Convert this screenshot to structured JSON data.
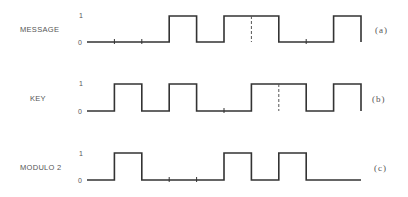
{
  "diagram": {
    "title": "",
    "x_start": 87,
    "bit_width": 27.4,
    "rows": [
      {
        "id": "message",
        "label": "MESSAGE",
        "tag": "(a)",
        "level_high": "1",
        "level_low": "0",
        "bits": [
          0,
          0,
          0,
          1,
          0,
          1,
          1,
          0,
          0,
          1
        ],
        "y_low": 42,
        "y_high": 16,
        "ticks": [
          1,
          2,
          8
        ],
        "dashes": [
          6
        ]
      },
      {
        "id": "key",
        "label": "KEY",
        "tag": "(b)",
        "level_high": "1",
        "level_low": "0",
        "bits": [
          0,
          1,
          0,
          1,
          0,
          0,
          1,
          1,
          0,
          1
        ],
        "y_low": 111,
        "y_high": 84,
        "ticks": [
          5
        ],
        "dashes": [
          7
        ]
      },
      {
        "id": "modulo2",
        "label": "MODULO 2",
        "tag": "(c)",
        "level_high": "1",
        "level_low": "0",
        "bits": [
          0,
          1,
          0,
          0,
          0,
          1,
          0,
          1,
          0,
          0
        ],
        "y_low": 180,
        "y_high": 153,
        "ticks": [
          3,
          4
        ],
        "dashes": []
      }
    ],
    "colors": {
      "line": "#333333",
      "text": "#555555",
      "background": "#ffffff"
    }
  }
}
